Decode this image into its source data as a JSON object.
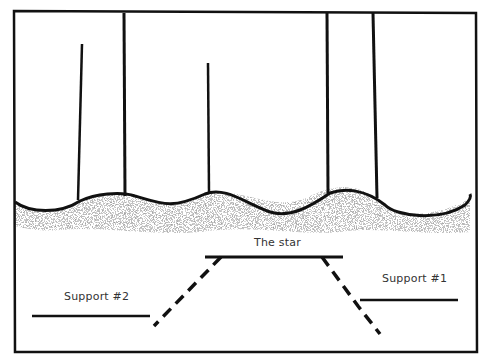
{
  "diagram": {
    "labels": {
      "star": "The star",
      "support1": "Support #1",
      "support2": "Support #2"
    },
    "colors": {
      "ink": "#111111",
      "shade": "#6a6a6a",
      "text": "#333333",
      "background": "#ffffff"
    }
  }
}
